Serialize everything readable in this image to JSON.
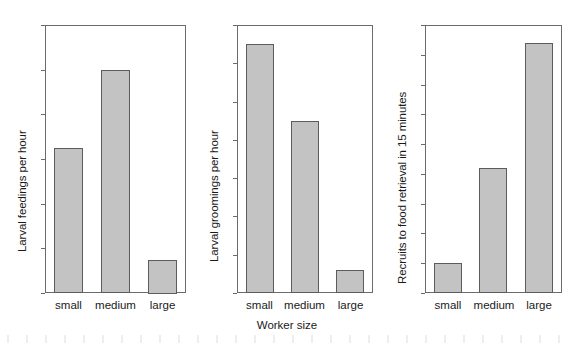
{
  "figure": {
    "xlabel": "Worker size",
    "categories": [
      "small",
      "medium",
      "large"
    ],
    "bar_fill_color": "#c3c3c3",
    "bar_edge_color": "#5c5c5c",
    "axis_color": "#6b6b6b"
  },
  "chart_data": [
    {
      "type": "bar",
      "title": "",
      "xlabel": "Worker size",
      "ylabel": "Larval feedings per hour",
      "categories": [
        "small",
        "medium",
        "large"
      ],
      "values": [
        13,
        20,
        3
      ],
      "ylim": [
        0,
        24
      ],
      "yticks": [
        0,
        4,
        8,
        12,
        16,
        20,
        24
      ],
      "ytick_labels": [
        "0",
        "4",
        "8",
        "12",
        "16",
        "20",
        "24"
      ],
      "grid": false,
      "legend": "none"
    },
    {
      "type": "bar",
      "title": "",
      "xlabel": "Worker size",
      "ylabel": "Larval groomings per hour",
      "categories": [
        "small",
        "medium",
        "large"
      ],
      "values": [
        65,
        45,
        6
      ],
      "ylim": [
        0,
        70
      ],
      "yticks": [
        0,
        10,
        20,
        30,
        40,
        50,
        60,
        70
      ],
      "ytick_labels": [
        "0",
        "10",
        "20",
        "30",
        "40",
        "50",
        "60",
        "70"
      ],
      "grid": false,
      "legend": "none"
    },
    {
      "type": "bar",
      "title": "",
      "xlabel": "Worker size",
      "ylabel": "Recruits to food retrieval in 15 minutes",
      "categories": [
        "small",
        "medium",
        "large"
      ],
      "values": [
        5,
        21,
        42
      ],
      "ylim": [
        0,
        45
      ],
      "yticks": [
        0,
        5,
        10,
        15,
        20,
        25,
        30,
        35,
        40,
        45
      ],
      "ytick_labels": [
        "0",
        "5",
        "10",
        "15",
        "20",
        "25",
        "30",
        "35",
        "40",
        "45"
      ],
      "grid": false,
      "legend": "none"
    }
  ]
}
